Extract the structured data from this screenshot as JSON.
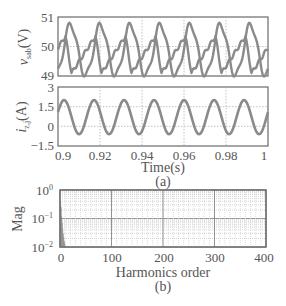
{
  "chart_data": [
    {
      "panel": "a-top",
      "type": "line",
      "ylabel": "v_sab(V)",
      "ylabel_main": "v",
      "ylabel_sub": "sab",
      "ylabel_unit": "(V)",
      "xlim": [
        0.9,
        1.0
      ],
      "ylim": [
        49,
        51
      ],
      "yticks": [
        "51",
        "50",
        "49"
      ],
      "grid": true,
      "series": [
        {
          "name": "v_sa",
          "description": "peaked waveform, ~7 cycles, range 49-50.8"
        },
        {
          "name": "v_sb",
          "description": "sawtooth-like waveform, ~7 cycles, range 49-50.3"
        }
      ],
      "frequency_cycles_in_window": 7
    },
    {
      "panel": "a-bottom",
      "type": "line",
      "ylabel": "i_z,j(A)",
      "ylabel_main": "i",
      "ylabel_sub": "z,j",
      "ylabel_unit": "(A)",
      "xlabel": "Time(s)",
      "xlim": [
        0.9,
        1.0
      ],
      "ylim": [
        -1.5,
        3
      ],
      "yticks": [
        "3",
        "1.5",
        "0",
        "−1.5"
      ],
      "xticks": [
        "0.9",
        "0.92",
        "0.94",
        "0.96",
        "0.98",
        "1"
      ],
      "grid": true,
      "series": [
        {
          "name": "i_z",
          "description": "sinusoid, ~7 cycles, range -0.6 to 2.0"
        }
      ],
      "caption": "(a)"
    },
    {
      "panel": "b",
      "type": "bar",
      "ylabel": "Mag",
      "xlabel": "Harmonics order",
      "xlim": [
        0,
        400
      ],
      "ylim_log": [
        0.01,
        1
      ],
      "yscale": "log",
      "xticks": [
        "0",
        "100",
        "200",
        "300",
        "400"
      ],
      "yticks": [
        "10^0",
        "10^-1",
        "10^-2"
      ],
      "grid": true,
      "categories": [
        1,
        2,
        3,
        4,
        5,
        6,
        7,
        8,
        9,
        10
      ],
      "values": [
        0.4,
        0.25,
        0.12,
        0.07,
        0.045,
        0.03,
        0.022,
        0.016,
        0.013,
        0.011
      ],
      "caption": "(b)"
    }
  ],
  "labels": {
    "top_y_ticks": [
      "51",
      "50",
      "49"
    ],
    "mid_y_ticks": [
      "3",
      "1.5",
      "0",
      "−1.5"
    ],
    "x_ticks_time": [
      "0.9",
      "0.92",
      "0.94",
      "0.96",
      "0.98",
      "1"
    ],
    "x_label_time": "Time(s)",
    "caption_a": "(a)",
    "spec_y_ticks_base": [
      "10",
      "10",
      "10"
    ],
    "spec_y_ticks_exp": [
      "0",
      "−1",
      "−2"
    ],
    "spec_x_ticks": [
      "0",
      "100",
      "200",
      "300",
      "400"
    ],
    "spec_x_label": "Harmonics order",
    "spec_y_label": "Mag",
    "caption_b": "(b)",
    "v_label_main": "v",
    "v_label_sub": "sab",
    "v_label_unit": "(V)",
    "i_label_main": "i",
    "i_label_sub": "z,j",
    "i_label_unit": "(A)"
  },
  "colors": {
    "line": "#8a8a8a",
    "axis": "#6a6a6a",
    "grid": "#b0b0b0",
    "bar": "#8a8a8a"
  }
}
